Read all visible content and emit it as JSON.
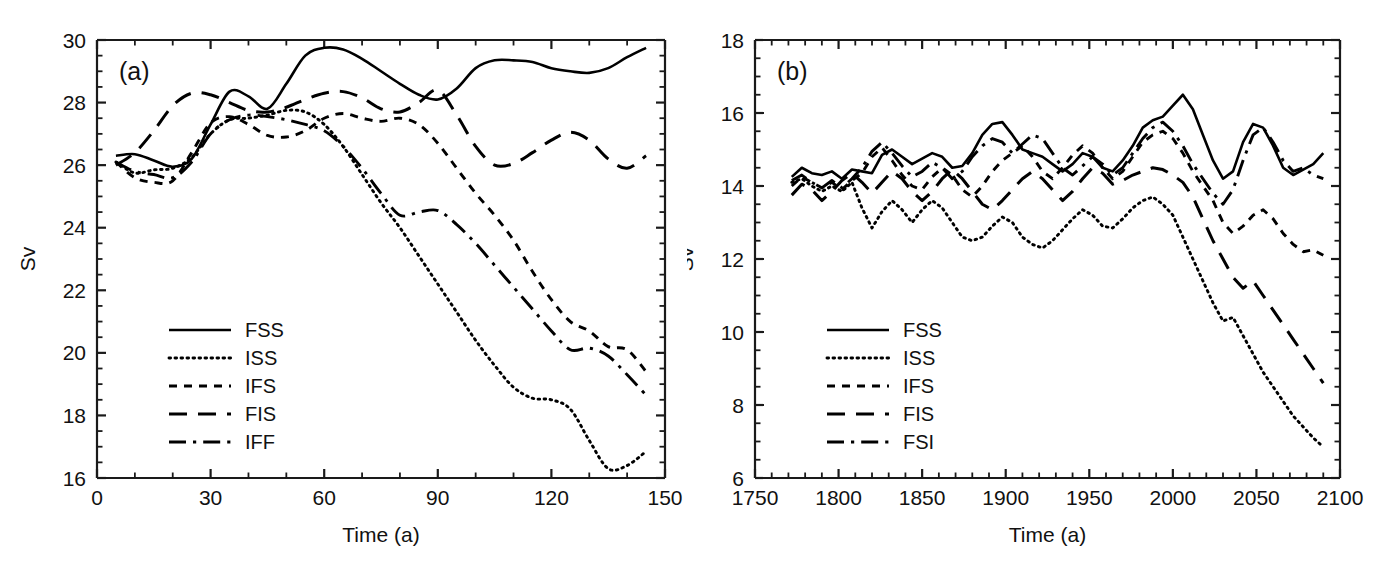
{
  "figure": {
    "background_color": "#ffffff",
    "line_color": "#000000",
    "panel_count": 2
  },
  "panel_a": {
    "letter": "(a)",
    "xlabel": "Time (a)",
    "ylabel": "Sv",
    "x_ticklabels": [
      "0",
      "30",
      "60",
      "90",
      "120",
      "150"
    ],
    "y_ticklabels": [
      "16",
      "18",
      "20",
      "22",
      "24",
      "26",
      "28",
      "30"
    ],
    "legend": [
      {
        "label": "FSS",
        "style": "solid"
      },
      {
        "label": "ISS",
        "style": "dotted"
      },
      {
        "label": "IFS",
        "style": "dashed-short"
      },
      {
        "label": "FIS",
        "style": "dashed-long"
      },
      {
        "label": "IFF",
        "style": "dash-dot"
      }
    ]
  },
  "panel_b": {
    "letter": "(b)",
    "xlabel": "Time (a)",
    "ylabel": "Sv",
    "x_ticklabels": [
      "1750",
      "1800",
      "1850",
      "1900",
      "1950",
      "2000",
      "2050",
      "2100"
    ],
    "y_ticklabels": [
      "6",
      "8",
      "10",
      "12",
      "14",
      "16",
      "18"
    ],
    "legend": [
      {
        "label": "FSS",
        "style": "solid"
      },
      {
        "label": "ISS",
        "style": "dotted"
      },
      {
        "label": "IFS",
        "style": "dashed-short"
      },
      {
        "label": "FIS",
        "style": "dashed-long"
      },
      {
        "label": "FSI",
        "style": "dash-dot"
      }
    ]
  },
  "chart_data": [
    {
      "type": "line",
      "panel": "(a)",
      "title": "",
      "xlabel": "Time (a)",
      "ylabel": "Sv",
      "xlim": [
        0,
        150
      ],
      "ylim": [
        16,
        30
      ],
      "xticks": [
        0,
        30,
        60,
        90,
        120,
        150
      ],
      "yticks": [
        16,
        18,
        20,
        22,
        24,
        26,
        28,
        30
      ],
      "xminor_step": 10,
      "yminor_step": 0.5,
      "grid": false,
      "legend_position": "lower-left",
      "series": [
        {
          "name": "FSS",
          "style": "solid",
          "x": [
            5,
            10,
            15,
            20,
            25,
            30,
            35,
            40,
            45,
            50,
            55,
            60,
            65,
            70,
            75,
            80,
            85,
            90,
            95,
            100,
            105,
            110,
            115,
            120,
            125,
            130,
            135,
            140,
            145
          ],
          "values": [
            26.3,
            26.35,
            26.15,
            25.95,
            26.2,
            27.3,
            28.35,
            28.2,
            27.8,
            28.6,
            29.5,
            29.75,
            29.7,
            29.4,
            29.0,
            28.6,
            28.25,
            28.1,
            28.45,
            29.1,
            29.35,
            29.35,
            29.3,
            29.1,
            29.0,
            28.95,
            29.1,
            29.45,
            29.75
          ]
        },
        {
          "name": "ISS",
          "style": "dotted",
          "x": [
            5,
            10,
            15,
            20,
            25,
            30,
            35,
            40,
            45,
            50,
            55,
            60,
            65,
            70,
            75,
            80,
            85,
            90,
            95,
            100,
            105,
            110,
            115,
            120,
            125,
            130,
            135,
            140,
            145
          ],
          "values": [
            26.1,
            25.75,
            25.85,
            25.9,
            26.25,
            27.0,
            27.45,
            27.5,
            27.6,
            27.75,
            27.7,
            27.3,
            26.6,
            25.7,
            24.8,
            24.0,
            23.1,
            22.2,
            21.3,
            20.4,
            19.6,
            18.9,
            18.55,
            18.5,
            18.2,
            17.2,
            16.3,
            16.4,
            16.85
          ]
        },
        {
          "name": "IFS",
          "style": "dashed-short",
          "x": [
            5,
            10,
            15,
            20,
            25,
            30,
            35,
            40,
            45,
            50,
            55,
            60,
            65,
            70,
            75,
            80,
            85,
            90,
            95,
            100,
            105,
            110,
            115,
            120,
            125,
            130,
            135,
            140,
            145
          ],
          "values": [
            26.1,
            25.6,
            25.45,
            25.5,
            26.4,
            27.35,
            27.55,
            27.3,
            26.95,
            26.9,
            27.1,
            27.5,
            27.65,
            27.5,
            27.4,
            27.5,
            27.3,
            26.7,
            25.9,
            25.1,
            24.4,
            23.6,
            22.6,
            21.7,
            21.0,
            20.7,
            20.2,
            20.1,
            19.4,
            18.65
          ]
        },
        {
          "name": "FIS",
          "style": "dashed-long",
          "x": [
            5,
            10,
            15,
            20,
            25,
            30,
            35,
            40,
            45,
            50,
            55,
            60,
            65,
            70,
            75,
            80,
            85,
            90,
            95,
            100,
            105,
            110,
            115,
            120,
            125,
            130,
            135,
            140,
            145
          ],
          "values": [
            26.0,
            26.4,
            27.1,
            27.9,
            28.3,
            28.25,
            28.0,
            27.75,
            27.7,
            27.85,
            28.1,
            28.3,
            28.35,
            28.15,
            27.8,
            27.7,
            28.0,
            28.4,
            27.6,
            26.6,
            26.0,
            26.05,
            26.4,
            26.8,
            27.05,
            26.8,
            26.2,
            25.9,
            26.3,
            26.45
          ]
        },
        {
          "name": "IFF",
          "style": "dash-dot",
          "x": [
            5,
            10,
            15,
            20,
            25,
            30,
            35,
            40,
            45,
            50,
            55,
            60,
            65,
            70,
            75,
            80,
            85,
            90,
            95,
            100,
            105,
            110,
            115,
            120,
            125,
            130,
            135,
            140,
            145
          ],
          "values": [
            26.1,
            25.8,
            25.7,
            25.6,
            26.1,
            27.0,
            27.45,
            27.6,
            27.55,
            27.45,
            27.3,
            27.1,
            26.6,
            25.9,
            25.1,
            24.4,
            24.5,
            24.55,
            24.1,
            23.5,
            22.8,
            22.1,
            21.4,
            20.7,
            20.1,
            20.15,
            19.9,
            19.3,
            18.65
          ]
        }
      ]
    },
    {
      "type": "line",
      "panel": "(b)",
      "title": "",
      "xlabel": "Time (a)",
      "ylabel": "Sv",
      "xlim": [
        1750,
        2100
      ],
      "ylim": [
        6,
        18
      ],
      "xticks": [
        1750,
        1800,
        1850,
        1900,
        1950,
        2000,
        2050,
        2100
      ],
      "yticks": [
        6,
        8,
        10,
        12,
        14,
        16,
        18
      ],
      "xminor_step": 10,
      "yminor_step": 0.5,
      "grid": false,
      "legend_position": "lower-left",
      "series": [
        {
          "name": "FSS",
          "style": "solid",
          "x": [
            1772,
            1778,
            1784,
            1790,
            1796,
            1802,
            1808,
            1814,
            1820,
            1826,
            1832,
            1838,
            1844,
            1850,
            1856,
            1862,
            1868,
            1874,
            1880,
            1886,
            1892,
            1898,
            1904,
            1910,
            1916,
            1922,
            1928,
            1934,
            1940,
            1946,
            1952,
            1958,
            1964,
            1970,
            1976,
            1982,
            1988,
            1994,
            2000,
            2006,
            2012,
            2018,
            2024,
            2030,
            2036,
            2042,
            2048,
            2054,
            2060,
            2066,
            2072,
            2078,
            2084,
            2090
          ],
          "values": [
            14.25,
            14.5,
            14.35,
            14.3,
            14.4,
            14.2,
            14.45,
            14.4,
            14.35,
            14.85,
            15.0,
            14.8,
            14.6,
            14.75,
            14.9,
            14.8,
            14.5,
            14.55,
            14.9,
            15.4,
            15.7,
            15.75,
            15.4,
            15.0,
            14.9,
            14.8,
            14.6,
            14.4,
            14.6,
            14.9,
            14.8,
            14.5,
            14.4,
            14.7,
            15.1,
            15.6,
            15.8,
            15.9,
            16.2,
            16.5,
            16.1,
            15.4,
            14.7,
            14.2,
            14.4,
            15.2,
            15.7,
            15.6,
            15.1,
            14.5,
            14.3,
            14.45,
            14.6,
            14.9
          ]
        },
        {
          "name": "ISS",
          "style": "dotted",
          "x": [
            1772,
            1778,
            1784,
            1790,
            1796,
            1802,
            1808,
            1814,
            1820,
            1826,
            1832,
            1838,
            1844,
            1850,
            1856,
            1862,
            1868,
            1874,
            1880,
            1886,
            1892,
            1898,
            1904,
            1910,
            1916,
            1922,
            1928,
            1934,
            1940,
            1946,
            1952,
            1958,
            1964,
            1970,
            1976,
            1982,
            1988,
            1994,
            2000,
            2006,
            2012,
            2018,
            2024,
            2030,
            2036,
            2042,
            2048,
            2054,
            2060,
            2066,
            2072,
            2078,
            2084,
            2090
          ],
          "values": [
            14.1,
            14.2,
            14.0,
            13.85,
            14.0,
            13.85,
            14.1,
            13.4,
            12.85,
            13.3,
            13.6,
            13.35,
            13.0,
            13.35,
            13.6,
            13.4,
            13.0,
            12.6,
            12.5,
            12.6,
            12.9,
            13.15,
            13.0,
            12.6,
            12.4,
            12.3,
            12.5,
            12.8,
            13.1,
            13.35,
            13.2,
            12.9,
            12.85,
            13.1,
            13.4,
            13.6,
            13.7,
            13.5,
            13.2,
            12.6,
            12.0,
            11.4,
            10.8,
            10.3,
            10.4,
            9.9,
            9.4,
            8.9,
            8.5,
            8.1,
            7.7,
            7.4,
            7.1,
            6.85
          ]
        },
        {
          "name": "IFS",
          "style": "dashed-short",
          "x": [
            1772,
            1778,
            1784,
            1790,
            1796,
            1802,
            1808,
            1814,
            1820,
            1826,
            1832,
            1838,
            1844,
            1850,
            1856,
            1862,
            1868,
            1874,
            1880,
            1886,
            1892,
            1898,
            1904,
            1910,
            1916,
            1922,
            1928,
            1934,
            1940,
            1946,
            1952,
            1958,
            1964,
            1970,
            1976,
            1982,
            1988,
            1994,
            2000,
            2006,
            2012,
            2018,
            2024,
            2030,
            2036,
            2042,
            2048,
            2054,
            2060,
            2066,
            2072,
            2078,
            2084,
            2090
          ],
          "values": [
            14.0,
            14.25,
            14.1,
            13.95,
            14.1,
            13.9,
            14.15,
            14.35,
            14.8,
            15.05,
            14.7,
            14.3,
            14.0,
            13.9,
            14.25,
            14.5,
            14.3,
            13.9,
            13.7,
            14.0,
            14.4,
            14.7,
            14.9,
            15.1,
            14.8,
            14.4,
            14.2,
            14.5,
            14.85,
            15.1,
            14.9,
            14.5,
            14.2,
            14.4,
            14.8,
            15.2,
            15.4,
            15.5,
            15.3,
            14.9,
            14.4,
            14.0,
            13.6,
            13.0,
            12.7,
            12.9,
            13.2,
            13.35,
            13.1,
            12.7,
            12.4,
            12.2,
            12.25,
            12.1
          ]
        },
        {
          "name": "FIS",
          "style": "dashed-long",
          "x": [
            1772,
            1778,
            1784,
            1790,
            1796,
            1802,
            1808,
            1814,
            1820,
            1826,
            1832,
            1838,
            1844,
            1850,
            1856,
            1862,
            1868,
            1874,
            1880,
            1886,
            1892,
            1898,
            1904,
            1910,
            1916,
            1922,
            1928,
            1934,
            1940,
            1946,
            1952,
            1958,
            1964,
            1970,
            1976,
            1982,
            1988,
            1994,
            2000,
            2006,
            2012,
            2018,
            2024,
            2030,
            2036,
            2042,
            2048,
            2054,
            2060,
            2066,
            2072,
            2078,
            2084,
            2090
          ],
          "values": [
            13.75,
            14.05,
            13.9,
            13.6,
            13.85,
            14.15,
            14.35,
            14.1,
            13.8,
            14.1,
            14.4,
            14.2,
            13.85,
            13.6,
            13.85,
            14.2,
            14.45,
            14.2,
            13.85,
            13.5,
            13.35,
            13.6,
            13.9,
            14.2,
            14.4,
            14.2,
            13.9,
            13.6,
            13.85,
            14.2,
            14.5,
            14.35,
            14.05,
            14.15,
            14.3,
            14.4,
            14.5,
            14.45,
            14.3,
            14.1,
            13.7,
            13.1,
            12.5,
            12.0,
            11.5,
            11.2,
            11.4,
            11.0,
            10.6,
            10.2,
            9.8,
            9.4,
            9.0,
            8.6
          ]
        },
        {
          "name": "FSI",
          "style": "dash-dot",
          "x": [
            1772,
            1778,
            1784,
            1790,
            1796,
            1802,
            1808,
            1814,
            1820,
            1826,
            1832,
            1838,
            1844,
            1850,
            1856,
            1862,
            1868,
            1874,
            1880,
            1886,
            1892,
            1898,
            1904,
            1910,
            1916,
            1922,
            1928,
            1934,
            1940,
            1946,
            1952,
            1958,
            1964,
            1970,
            1976,
            1982,
            1988,
            1994,
            2000,
            2006,
            2012,
            2018,
            2024,
            2030,
            2036,
            2042,
            2048,
            2054,
            2060,
            2066,
            2072,
            2078,
            2084,
            2090
          ],
          "values": [
            14.15,
            14.3,
            14.1,
            13.95,
            14.15,
            13.95,
            14.2,
            14.5,
            14.95,
            15.2,
            14.9,
            14.55,
            14.25,
            14.4,
            14.65,
            14.5,
            14.2,
            14.4,
            14.8,
            15.1,
            15.3,
            15.2,
            14.9,
            15.15,
            15.4,
            15.3,
            14.9,
            14.5,
            14.3,
            14.55,
            14.8,
            14.6,
            14.3,
            14.5,
            14.9,
            15.3,
            15.6,
            15.75,
            15.5,
            15.1,
            14.6,
            14.2,
            13.8,
            13.5,
            13.9,
            14.7,
            15.4,
            15.6,
            15.2,
            14.7,
            14.4,
            14.5,
            14.3,
            14.2
          ]
        }
      ]
    }
  ]
}
